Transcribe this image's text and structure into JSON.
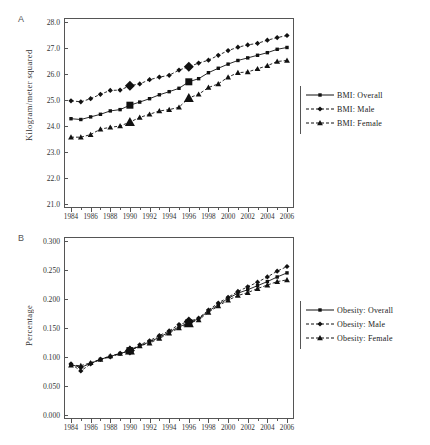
{
  "figure": {
    "panels": [
      {
        "letter": "A",
        "ylabel": "Kilogram/meter squared",
        "legend": [
          {
            "label": "BMI: Overall",
            "marker": "square",
            "dash": "solid"
          },
          {
            "label": "BMI: Male",
            "marker": "diamond",
            "dash": "dashed"
          },
          {
            "label": "BMI: Female",
            "marker": "triangle",
            "dash": "dashed"
          }
        ]
      },
      {
        "letter": "B",
        "ylabel": "Percentage",
        "legend": [
          {
            "label": "Obesity: Overall",
            "marker": "square",
            "dash": "solid"
          },
          {
            "label": "Obesity: Male",
            "marker": "diamond",
            "dash": "dashed"
          },
          {
            "label": "Obesity: Female",
            "marker": "triangle",
            "dash": "dashed"
          }
        ]
      }
    ]
  },
  "chart_data": [
    {
      "type": "line",
      "panel": "A",
      "title": "",
      "xlabel": "",
      "ylabel": "Kilogram/meter squared",
      "ylim": [
        21.0,
        28.0
      ],
      "ytick_step": 1.0,
      "ytick_labels": [
        "28.0",
        "27.0",
        "26.0",
        "25.0",
        "24.0",
        "23.0",
        "22.0",
        "21.0"
      ],
      "ytick_values": [
        28.0,
        27.0,
        26.0,
        25.0,
        24.0,
        23.0,
        22.0,
        21.0
      ],
      "xlim": [
        1984,
        2006
      ],
      "x": [
        1984,
        1985,
        1986,
        1987,
        1988,
        1989,
        1990,
        1991,
        1992,
        1993,
        1994,
        1995,
        1996,
        1997,
        1998,
        1999,
        2000,
        2001,
        2002,
        2003,
        2004,
        2005,
        2006
      ],
      "xtick_labels": [
        "1984",
        "1986",
        "1988",
        "1990",
        "1992",
        "1994",
        "1996",
        "1998",
        "2000",
        "2002",
        "2004",
        "2006"
      ],
      "xtick_values": [
        1984,
        1986,
        1988,
        1990,
        1992,
        1994,
        1996,
        1998,
        2000,
        2002,
        2004,
        2006
      ],
      "grid": false,
      "legend_position": "right",
      "highlight_years": [
        1990,
        1996
      ],
      "series": [
        {
          "name": "BMI: Overall",
          "marker": "square",
          "dash": "solid",
          "values": [
            24.28,
            24.25,
            24.35,
            24.45,
            24.58,
            24.63,
            24.8,
            24.92,
            25.05,
            25.2,
            25.32,
            25.45,
            25.7,
            25.82,
            26.05,
            26.22,
            26.38,
            26.52,
            26.62,
            26.72,
            26.82,
            26.95,
            27.02
          ]
        },
        {
          "name": "BMI: Male",
          "marker": "diamond",
          "dash": "dashed",
          "values": [
            24.97,
            24.93,
            25.05,
            25.22,
            25.37,
            25.38,
            25.55,
            25.62,
            25.78,
            25.88,
            25.95,
            26.15,
            26.28,
            26.42,
            26.53,
            26.72,
            26.9,
            27.03,
            27.12,
            27.18,
            27.3,
            27.4,
            27.48
          ]
        },
        {
          "name": "BMI: Female",
          "marker": "triangle",
          "dash": "dashed",
          "values": [
            23.57,
            23.57,
            23.67,
            23.88,
            23.95,
            24.0,
            24.15,
            24.33,
            24.45,
            24.58,
            24.63,
            24.72,
            25.08,
            25.22,
            25.48,
            25.62,
            25.88,
            26.05,
            26.08,
            26.2,
            26.32,
            26.48,
            26.52
          ]
        }
      ]
    },
    {
      "type": "line",
      "panel": "B",
      "title": "",
      "xlabel": "",
      "ylabel": "Percentage",
      "ylim": [
        0.0,
        0.3
      ],
      "ytick_step": 0.05,
      "ytick_labels": [
        "0.300",
        "0.250",
        "0.200",
        "0.150",
        "0.100",
        "0.050",
        "0.000"
      ],
      "ytick_values": [
        0.3,
        0.25,
        0.2,
        0.15,
        0.1,
        0.05,
        0.0
      ],
      "xlim": [
        1984,
        2006
      ],
      "x": [
        1984,
        1985,
        1986,
        1987,
        1988,
        1989,
        1990,
        1991,
        1992,
        1993,
        1994,
        1995,
        1996,
        1997,
        1998,
        1999,
        2000,
        2001,
        2002,
        2003,
        2004,
        2005,
        2006
      ],
      "xtick_labels": [
        "1984",
        "1986",
        "1988",
        "1990",
        "1992",
        "1994",
        "1996",
        "1998",
        "2000",
        "2002",
        "2004",
        "2006"
      ],
      "xtick_values": [
        1984,
        1986,
        1988,
        1990,
        1992,
        1994,
        1996,
        1998,
        2000,
        2002,
        2004,
        2006
      ],
      "grid": false,
      "legend_position": "right",
      "highlight_years": [
        1990,
        1996
      ],
      "series": [
        {
          "name": "Obesity: Overall",
          "marker": "square",
          "dash": "solid",
          "values": [
            0.087,
            0.082,
            0.089,
            0.096,
            0.101,
            0.106,
            0.111,
            0.119,
            0.126,
            0.134,
            0.143,
            0.152,
            0.159,
            0.166,
            0.179,
            0.19,
            0.201,
            0.21,
            0.216,
            0.223,
            0.23,
            0.238,
            0.245
          ]
        },
        {
          "name": "Obesity: Male",
          "marker": "diamond",
          "dash": "dashed",
          "values": [
            0.088,
            0.076,
            0.088,
            0.096,
            0.1,
            0.106,
            0.111,
            0.121,
            0.128,
            0.137,
            0.145,
            0.156,
            0.161,
            0.167,
            0.181,
            0.193,
            0.203,
            0.213,
            0.221,
            0.229,
            0.238,
            0.248,
            0.256
          ]
        },
        {
          "name": "Obesity: Female",
          "marker": "triangle",
          "dash": "dashed",
          "values": [
            0.086,
            0.085,
            0.09,
            0.096,
            0.102,
            0.106,
            0.111,
            0.119,
            0.124,
            0.132,
            0.141,
            0.15,
            0.158,
            0.164,
            0.177,
            0.188,
            0.198,
            0.206,
            0.211,
            0.218,
            0.224,
            0.23,
            0.233
          ]
        }
      ]
    }
  ]
}
